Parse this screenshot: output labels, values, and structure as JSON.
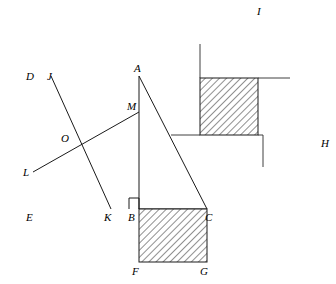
{
  "figure": {
    "canvas": {
      "width": 336,
      "height": 284,
      "background": "#ffffff"
    },
    "stroke_color": "#1a1a1a",
    "hatch_color": "#2e2e2e",
    "hatch_fill_background": "#ffffff",
    "labels": {
      "A": "A",
      "B": "B",
      "C": "C",
      "D": "D",
      "E": "E",
      "F": "F",
      "G": "G",
      "H": "H",
      "I": "I",
      "J": "J",
      "K": "K",
      "L": "L",
      "M": "M",
      "O": "O"
    },
    "points": {
      "A": {
        "x": 139,
        "y": 76
      },
      "B": {
        "x": 139,
        "y": 209
      },
      "C": {
        "x": 207,
        "y": 209
      },
      "D": {
        "x": 33,
        "y": 76
      },
      "E": {
        "x": 33,
        "y": 209
      },
      "F": {
        "x": 139,
        "y": 262
      },
      "G": {
        "x": 207,
        "y": 262
      },
      "H": {
        "x": 317,
        "y": 143
      },
      "I": {
        "x": 260,
        "y": 21
      },
      "J": {
        "x": 51,
        "y": 76
      },
      "K": {
        "x": 111,
        "y": 209
      },
      "L": {
        "x": 33,
        "y": 172
      },
      "M": {
        "x": 139,
        "y": 112
      },
      "O": {
        "x": 70,
        "y": 142
      }
    },
    "label_offsets": {
      "A": {
        "x": 134,
        "y": 70
      },
      "B": {
        "x": 131,
        "y": 219
      },
      "C": {
        "x": 205,
        "y": 219
      },
      "D": {
        "x": 26,
        "y": 70
      },
      "E": {
        "x": 26,
        "y": 219
      },
      "F": {
        "x": 132,
        "y": 274
      },
      "G": {
        "x": 200,
        "y": 274
      },
      "H": {
        "x": 321,
        "y": 145
      },
      "I": {
        "x": 258,
        "y": 13
      },
      "J": {
        "x": 47,
        "y": 70
      },
      "K": {
        "x": 104,
        "y": 219
      },
      "L": {
        "x": 24,
        "y": 176
      },
      "M": {
        "x": 126,
        "y": 108
      },
      "O": {
        "x": 61,
        "y": 139
      }
    },
    "squares": {
      "left_square_on_leg_AB": [
        "D",
        "A",
        "B",
        "E"
      ],
      "bottom_square_on_leg_BC": [
        "B",
        "C",
        "G",
        "F"
      ],
      "tilted_square_on_hypotenuse_AC": [
        "A",
        "I",
        "H",
        "C"
      ]
    },
    "triangle": [
      "A",
      "B",
      "C"
    ],
    "dissection_lines": [
      {
        "name": "line-J-K",
        "from": "J",
        "to": "K"
      },
      {
        "name": "line-L-M",
        "from": "L",
        "to": "M"
      },
      {
        "name": "segment-B-M",
        "from": "B",
        "to": "M"
      }
    ],
    "hatched_regions": [
      {
        "name": "hatched-square-BCGF",
        "points": [
          [
            139,
            209
          ],
          [
            207,
            209
          ],
          [
            207,
            262
          ],
          [
            139,
            262
          ]
        ]
      },
      {
        "name": "hatched-square-inner-upper",
        "points": [
          [
            200,
            78
          ],
          [
            258,
            78
          ],
          [
            258,
            135
          ],
          [
            200,
            135
          ]
        ]
      }
    ],
    "inner_partition_polylines": [
      {
        "name": "inner-upper-left-riser",
        "points": [
          [
            200,
            78
          ],
          [
            200,
            135
          ]
        ]
      },
      {
        "name": "inner-upper-top-riser",
        "points": [
          [
            200,
            44
          ],
          [
            200,
            78
          ]
        ]
      },
      {
        "name": "inner-upper-right-top",
        "points": [
          [
            258,
            78
          ],
          [
            290,
            78
          ]
        ]
      },
      {
        "name": "inner-mid-horizontal",
        "points": [
          [
            171,
            135
          ],
          [
            258,
            135
          ]
        ]
      },
      {
        "name": "inner-right-riser",
        "points": [
          [
            263,
            135
          ],
          [
            263,
            167
          ]
        ]
      }
    ],
    "right_angle_marker": {
      "name": "right-angle-at-B",
      "x": 129,
      "y": 198,
      "size": 10
    }
  }
}
